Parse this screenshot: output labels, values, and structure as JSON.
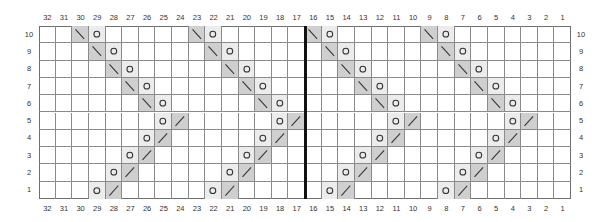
{
  "chart_data": {
    "type": "knitting-chart-grid",
    "title": "",
    "columns": 32,
    "rows": 10,
    "column_labels": [
      32,
      31,
      30,
      29,
      28,
      27,
      26,
      25,
      24,
      23,
      22,
      21,
      20,
      19,
      18,
      17,
      16,
      15,
      14,
      13,
      12,
      11,
      10,
      9,
      8,
      7,
      6,
      5,
      4,
      3,
      2,
      1
    ],
    "row_labels": [
      10,
      9,
      8,
      7,
      6,
      5,
      4,
      3,
      2,
      1
    ],
    "divider_after_column": 17,
    "colors": {
      "decrease_bg": "#cfcfcf",
      "yarnover_bg": "#ececec",
      "empty_bg": "#ffffff",
      "grid_line": "#8a8a8a",
      "divider": "#111111",
      "label": "#333333"
    },
    "symbols": {
      "yo": "yarn-over (circle)",
      "ssk": "left-leaning decrease (backslash)",
      "k2tog": "right-leaning decrease (slash)"
    },
    "cells": [
      {
        "row": 10,
        "col": 30,
        "sym": "ssk"
      },
      {
        "row": 10,
        "col": 29,
        "sym": "yo"
      },
      {
        "row": 10,
        "col": 23,
        "sym": "ssk"
      },
      {
        "row": 10,
        "col": 22,
        "sym": "yo"
      },
      {
        "row": 10,
        "col": 16,
        "sym": "ssk"
      },
      {
        "row": 10,
        "col": 15,
        "sym": "yo"
      },
      {
        "row": 10,
        "col": 9,
        "sym": "ssk"
      },
      {
        "row": 10,
        "col": 8,
        "sym": "yo"
      },
      {
        "row": 9,
        "col": 29,
        "sym": "ssk"
      },
      {
        "row": 9,
        "col": 28,
        "sym": "yo"
      },
      {
        "row": 9,
        "col": 22,
        "sym": "ssk"
      },
      {
        "row": 9,
        "col": 21,
        "sym": "yo"
      },
      {
        "row": 9,
        "col": 15,
        "sym": "ssk"
      },
      {
        "row": 9,
        "col": 14,
        "sym": "yo"
      },
      {
        "row": 9,
        "col": 8,
        "sym": "ssk"
      },
      {
        "row": 9,
        "col": 7,
        "sym": "yo"
      },
      {
        "row": 8,
        "col": 28,
        "sym": "ssk"
      },
      {
        "row": 8,
        "col": 27,
        "sym": "yo"
      },
      {
        "row": 8,
        "col": 21,
        "sym": "ssk"
      },
      {
        "row": 8,
        "col": 20,
        "sym": "yo"
      },
      {
        "row": 8,
        "col": 14,
        "sym": "ssk"
      },
      {
        "row": 8,
        "col": 13,
        "sym": "yo"
      },
      {
        "row": 8,
        "col": 7,
        "sym": "ssk"
      },
      {
        "row": 8,
        "col": 6,
        "sym": "yo"
      },
      {
        "row": 7,
        "col": 27,
        "sym": "ssk"
      },
      {
        "row": 7,
        "col": 26,
        "sym": "yo"
      },
      {
        "row": 7,
        "col": 20,
        "sym": "ssk"
      },
      {
        "row": 7,
        "col": 19,
        "sym": "yo"
      },
      {
        "row": 7,
        "col": 13,
        "sym": "ssk"
      },
      {
        "row": 7,
        "col": 12,
        "sym": "yo"
      },
      {
        "row": 7,
        "col": 6,
        "sym": "ssk"
      },
      {
        "row": 7,
        "col": 5,
        "sym": "yo"
      },
      {
        "row": 6,
        "col": 26,
        "sym": "ssk"
      },
      {
        "row": 6,
        "col": 25,
        "sym": "yo"
      },
      {
        "row": 6,
        "col": 19,
        "sym": "ssk"
      },
      {
        "row": 6,
        "col": 18,
        "sym": "yo"
      },
      {
        "row": 6,
        "col": 12,
        "sym": "ssk"
      },
      {
        "row": 6,
        "col": 11,
        "sym": "yo"
      },
      {
        "row": 6,
        "col": 5,
        "sym": "ssk"
      },
      {
        "row": 6,
        "col": 4,
        "sym": "yo"
      },
      {
        "row": 5,
        "col": 25,
        "sym": "yo"
      },
      {
        "row": 5,
        "col": 24,
        "sym": "k2tog"
      },
      {
        "row": 5,
        "col": 18,
        "sym": "yo"
      },
      {
        "row": 5,
        "col": 17,
        "sym": "k2tog"
      },
      {
        "row": 5,
        "col": 11,
        "sym": "yo"
      },
      {
        "row": 5,
        "col": 10,
        "sym": "k2tog"
      },
      {
        "row": 5,
        "col": 4,
        "sym": "yo"
      },
      {
        "row": 5,
        "col": 3,
        "sym": "k2tog"
      },
      {
        "row": 4,
        "col": 26,
        "sym": "yo"
      },
      {
        "row": 4,
        "col": 25,
        "sym": "k2tog"
      },
      {
        "row": 4,
        "col": 19,
        "sym": "yo"
      },
      {
        "row": 4,
        "col": 18,
        "sym": "k2tog"
      },
      {
        "row": 4,
        "col": 12,
        "sym": "yo"
      },
      {
        "row": 4,
        "col": 11,
        "sym": "k2tog"
      },
      {
        "row": 4,
        "col": 5,
        "sym": "yo"
      },
      {
        "row": 4,
        "col": 4,
        "sym": "k2tog"
      },
      {
        "row": 3,
        "col": 27,
        "sym": "yo"
      },
      {
        "row": 3,
        "col": 26,
        "sym": "k2tog"
      },
      {
        "row": 3,
        "col": 20,
        "sym": "yo"
      },
      {
        "row": 3,
        "col": 19,
        "sym": "k2tog"
      },
      {
        "row": 3,
        "col": 13,
        "sym": "yo"
      },
      {
        "row": 3,
        "col": 12,
        "sym": "k2tog"
      },
      {
        "row": 3,
        "col": 6,
        "sym": "yo"
      },
      {
        "row": 3,
        "col": 5,
        "sym": "k2tog"
      },
      {
        "row": 2,
        "col": 28,
        "sym": "yo"
      },
      {
        "row": 2,
        "col": 27,
        "sym": "k2tog"
      },
      {
        "row": 2,
        "col": 21,
        "sym": "yo"
      },
      {
        "row": 2,
        "col": 20,
        "sym": "k2tog"
      },
      {
        "row": 2,
        "col": 14,
        "sym": "yo"
      },
      {
        "row": 2,
        "col": 13,
        "sym": "k2tog"
      },
      {
        "row": 2,
        "col": 7,
        "sym": "yo"
      },
      {
        "row": 2,
        "col": 6,
        "sym": "k2tog"
      },
      {
        "row": 1,
        "col": 29,
        "sym": "yo"
      },
      {
        "row": 1,
        "col": 28,
        "sym": "k2tog"
      },
      {
        "row": 1,
        "col": 22,
        "sym": "yo"
      },
      {
        "row": 1,
        "col": 21,
        "sym": "k2tog"
      },
      {
        "row": 1,
        "col": 15,
        "sym": "yo"
      },
      {
        "row": 1,
        "col": 14,
        "sym": "k2tog"
      },
      {
        "row": 1,
        "col": 8,
        "sym": "yo"
      },
      {
        "row": 1,
        "col": 7,
        "sym": "k2tog"
      }
    ]
  }
}
